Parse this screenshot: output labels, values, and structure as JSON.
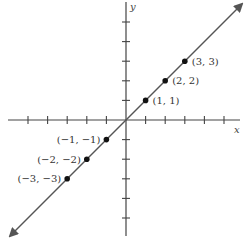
{
  "chart_data": {
    "type": "line",
    "title": "",
    "xlabel": "x",
    "ylabel": "y",
    "equation": "y = x",
    "xlim": [
      -6,
      6
    ],
    "ylim": [
      -6,
      6
    ],
    "grid": false,
    "x_ticks": [
      -5,
      -4,
      -3,
      -2,
      -1,
      1,
      2,
      3,
      4,
      5
    ],
    "y_ticks": [
      -5,
      -4,
      -3,
      -2,
      -1,
      1,
      2,
      3,
      4,
      5
    ],
    "line": {
      "from": [
        -6,
        -6
      ],
      "to": [
        6,
        6
      ],
      "arrows": "both"
    },
    "points": [
      {
        "x": 1,
        "y": 1,
        "label": "(1, 1)"
      },
      {
        "x": 2,
        "y": 2,
        "label": "(2, 2)"
      },
      {
        "x": 3,
        "y": 3,
        "label": "(3, 3)"
      },
      {
        "x": -1,
        "y": -1,
        "label": "(−1, −1)"
      },
      {
        "x": -2,
        "y": -2,
        "label": "(−2, −2)"
      },
      {
        "x": -3,
        "y": -3,
        "label": "(−3, −3)"
      }
    ]
  },
  "colors": {
    "axis": "#444444",
    "line": "#555555",
    "point": "#111111"
  }
}
